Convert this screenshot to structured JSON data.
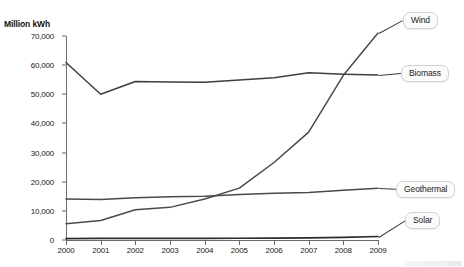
{
  "chart_data": {
    "type": "line",
    "title": "",
    "xlabel": "",
    "ylabel": "Million kWh",
    "categories": [
      "2000",
      "2001",
      "2002",
      "2003",
      "2004",
      "2005",
      "2006",
      "2007",
      "2008",
      "2009"
    ],
    "ylim": [
      0,
      70000
    ],
    "yticks": [
      0,
      10000,
      20000,
      30000,
      40000,
      50000,
      60000,
      70000
    ],
    "ytick_labels": [
      "0",
      "10,000",
      "20,000",
      "30,000",
      "40,000",
      "50,000",
      "60,000",
      "70,000"
    ],
    "grid": false,
    "legend_position": "right-inline-labels",
    "series": [
      {
        "name": "Wind",
        "color": "#4a4a4a",
        "values": [
          5600,
          6700,
          10400,
          11200,
          14100,
          17800,
          26600,
          37000,
          56500,
          71000
        ]
      },
      {
        "name": "Biomass",
        "color": "#3f3f3f",
        "values": [
          60900,
          50000,
          54400,
          54200,
          54100,
          54900,
          55700,
          57400,
          56900,
          56600
        ]
      },
      {
        "name": "Geothermal",
        "color": "#4a4a4a",
        "values": [
          14100,
          13900,
          14500,
          14800,
          15000,
          15600,
          16000,
          16300,
          17100,
          17800
        ]
      },
      {
        "name": "Solar",
        "color": "#2b2b2b",
        "values": [
          500,
          550,
          570,
          580,
          590,
          600,
          650,
          720,
          900,
          1200
        ]
      }
    ]
  },
  "axis": {
    "y_title": "Million kWh"
  },
  "legend": {
    "wind": "Wind",
    "biomass": "Biomass",
    "geothermal": "Geothermal",
    "solar": "Solar"
  },
  "clipped_title": ""
}
